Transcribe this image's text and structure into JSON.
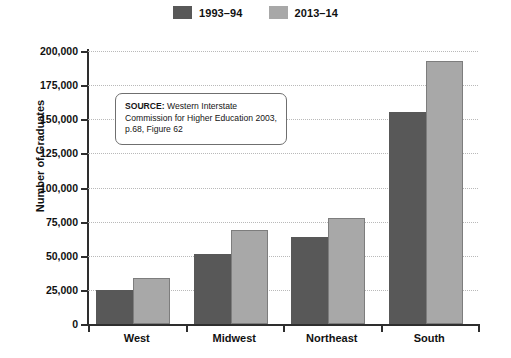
{
  "chart_data": {
    "type": "bar",
    "title": "",
    "xlabel": "",
    "ylabel": "Number of Graduates",
    "categories": [
      "West",
      "Midwest",
      "Northeast",
      "South"
    ],
    "series": [
      {
        "name": "1993–94",
        "color": "#585858",
        "values": [
          25000,
          51000,
          63500,
          155000
        ]
      },
      {
        "name": "2013–14",
        "color": "#a8a8a8",
        "values": [
          34000,
          69000,
          78000,
          193000
        ]
      }
    ],
    "ylim": [
      0,
      200000
    ],
    "ytick_step": 25000,
    "ytick_labels": [
      "0",
      "25,000",
      "50,000",
      "75,000",
      "100,000",
      "125,000",
      "150,000",
      "175,000",
      "200,000"
    ],
    "ytick_values": [
      0,
      25000,
      50000,
      75000,
      100000,
      125000,
      150000,
      175000,
      200000
    ],
    "grid": "horizontal-dotted",
    "legend_position": "top-center"
  },
  "legend": {
    "items": [
      {
        "label": "1993–94",
        "color": "#585858",
        "icon": "legend-swatch-dark"
      },
      {
        "label": "2013–14",
        "color": "#a8a8a8",
        "icon": "legend-swatch-light"
      }
    ]
  },
  "axis": {
    "y_title": "Number of Graduates"
  },
  "source": {
    "prefix": "SOURCE:",
    "text": " Western Interstate Commission for Higher Education 2003, p.68, Figure 62"
  }
}
